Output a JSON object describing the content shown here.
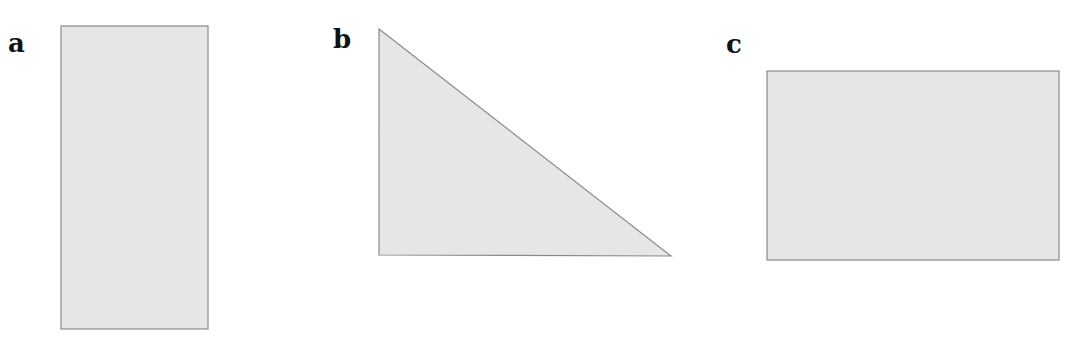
{
  "colors": {
    "fill": "#e6e6e6",
    "stroke": "#8a8a8a",
    "label": "#111111"
  },
  "labels": {
    "a": "a",
    "b": "b",
    "c": "c"
  },
  "shapes": {
    "a": {
      "type": "rectangle",
      "x": 61,
      "y": 26,
      "width": 147,
      "height": 303
    },
    "b": {
      "type": "right-triangle",
      "points": "379,29 379,255 671,256"
    },
    "c": {
      "type": "rectangle",
      "x": 767,
      "y": 71,
      "width": 292,
      "height": 189
    }
  }
}
